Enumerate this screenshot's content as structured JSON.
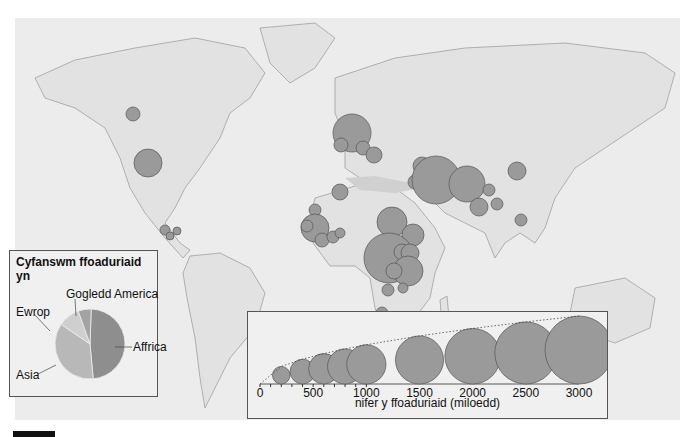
{
  "map": {
    "background": "#ececec",
    "land_color": "#e4e4e4",
    "sea_highlight": "#d2d2d2",
    "circle_color": "#9a9a9a",
    "circle_stroke": "#555555",
    "circles": [
      {
        "region": "Canada",
        "cx": 133,
        "cy": 114,
        "r": 7
      },
      {
        "region": "USA",
        "cx": 148,
        "cy": 163,
        "r": 14
      },
      {
        "region": "Central America 1",
        "cx": 165,
        "cy": 230,
        "r": 5
      },
      {
        "region": "Central America 2",
        "cx": 170,
        "cy": 236,
        "r": 4
      },
      {
        "region": "Central America 3",
        "cx": 177,
        "cy": 231,
        "r": 4
      },
      {
        "region": "Germany",
        "cx": 352,
        "cy": 133,
        "r": 19
      },
      {
        "region": "UK",
        "cx": 341,
        "cy": 145,
        "r": 7
      },
      {
        "region": "Central Europe",
        "cx": 363,
        "cy": 148,
        "r": 7
      },
      {
        "region": "Balkans",
        "cx": 374,
        "cy": 155,
        "r": 8
      },
      {
        "region": "Algeria",
        "cx": 340,
        "cy": 192,
        "r": 8
      },
      {
        "region": "Middle East A",
        "cx": 422,
        "cy": 166,
        "r": 9
      },
      {
        "region": "Middle East B",
        "cx": 415,
        "cy": 182,
        "r": 7
      },
      {
        "region": "Iran",
        "cx": 436,
        "cy": 180,
        "r": 24
      },
      {
        "region": "Pakistan",
        "cx": 467,
        "cy": 184,
        "r": 18
      },
      {
        "region": "China",
        "cx": 517,
        "cy": 171,
        "r": 9
      },
      {
        "region": "Nepal",
        "cx": 489,
        "cy": 190,
        "r": 6
      },
      {
        "region": "India",
        "cx": 479,
        "cy": 207,
        "r": 9
      },
      {
        "region": "Bangladesh",
        "cx": 497,
        "cy": 204,
        "r": 6
      },
      {
        "region": "Thailand",
        "cx": 521,
        "cy": 220,
        "r": 6
      },
      {
        "region": "West Africa",
        "cx": 315,
        "cy": 210,
        "r": 6
      },
      {
        "region": "Guinea",
        "cx": 315,
        "cy": 228,
        "r": 14
      },
      {
        "region": "Sierra Leone",
        "cx": 307,
        "cy": 226,
        "r": 6
      },
      {
        "region": "Liberia",
        "cx": 322,
        "cy": 240,
        "r": 7
      },
      {
        "region": "Cote d'Ivoire",
        "cx": 333,
        "cy": 237,
        "r": 6
      },
      {
        "region": "Ghana",
        "cx": 340,
        "cy": 233,
        "r": 5
      },
      {
        "region": "Sudan",
        "cx": 392,
        "cy": 222,
        "r": 15
      },
      {
        "region": "Ethiopia",
        "cx": 413,
        "cy": 235,
        "r": 11
      },
      {
        "region": "DR Congo",
        "cx": 389,
        "cy": 258,
        "r": 25
      },
      {
        "region": "Uganda",
        "cx": 402,
        "cy": 252,
        "r": 8
      },
      {
        "region": "Kenya",
        "cx": 410,
        "cy": 253,
        "r": 9
      },
      {
        "region": "Tanzania",
        "cx": 408,
        "cy": 271,
        "r": 15
      },
      {
        "region": "Rwanda",
        "cx": 394,
        "cy": 271,
        "r": 8
      },
      {
        "region": "Zambia",
        "cx": 388,
        "cy": 290,
        "r": 6
      },
      {
        "region": "Malawi",
        "cx": 403,
        "cy": 288,
        "r": 5
      },
      {
        "region": "South Africa",
        "cx": 382,
        "cy": 313,
        "r": 6
      }
    ]
  },
  "pie_legend": {
    "title": "Cyfanswm ffoaduriaid yn",
    "slices": [
      {
        "label": "Affrica",
        "percent": 48,
        "color": "#8e8e8e"
      },
      {
        "label": "Asia",
        "percent": 36,
        "color": "#b8b8b8"
      },
      {
        "label": "Ewrop",
        "percent": 10,
        "color": "#cfcfcf"
      },
      {
        "label": "Gogledd America",
        "percent": 6,
        "color": "#a3a3a3"
      }
    ]
  },
  "size_legend": {
    "axis_label": "nifer y ffoaduriaid (miloedd)",
    "ticks": [
      "0",
      "500",
      "1000",
      "1500",
      "2000",
      "2500",
      "3000"
    ],
    "circle_values": [
      200,
      400,
      600,
      800,
      1000,
      1500,
      2000,
      2500,
      3000
    ]
  },
  "chart_data": {
    "type": "pie",
    "title": "Cyfanswm ffoaduriaid yn",
    "categories": [
      "Affrica",
      "Asia",
      "Ewrop",
      "Gogledd America"
    ],
    "values": [
      48,
      36,
      10,
      6
    ],
    "legend_scale": {
      "label": "nifer y ffoaduriaid (miloedd)",
      "ticks": [
        0,
        500,
        1000,
        1500,
        2000,
        2500,
        3000
      ],
      "circles": [
        200,
        400,
        600,
        800,
        1000,
        1500,
        2000,
        2500,
        3000
      ]
    }
  }
}
